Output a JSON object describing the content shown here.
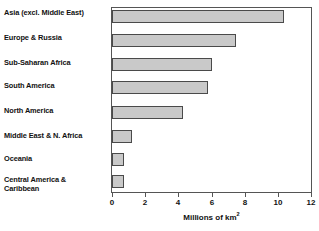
{
  "chart_data": {
    "type": "bar",
    "orientation": "horizontal",
    "title": "",
    "xlabel": "Millions of km²",
    "ylabel": "",
    "xlim": [
      0,
      12
    ],
    "xticks": [
      0,
      2,
      4,
      6,
      8,
      10,
      12
    ],
    "grid": false,
    "legend": null,
    "categories": [
      "Asia (excl. Middle East)",
      "Europe & Russia",
      "Sub-Saharan Africa",
      "South America",
      "North America",
      "Middle East & N. Africa",
      "Oceania",
      "Central America &\nCaribbean"
    ],
    "values": [
      10.4,
      7.5,
      6.0,
      5.8,
      4.3,
      1.2,
      0.75,
      0.7
    ],
    "colors": {
      "bar_fill": "#c9c9c9",
      "bar_stroke": "#4a4a4a",
      "axis": "#555555",
      "text": "#111111",
      "background": "#ffffff"
    }
  }
}
